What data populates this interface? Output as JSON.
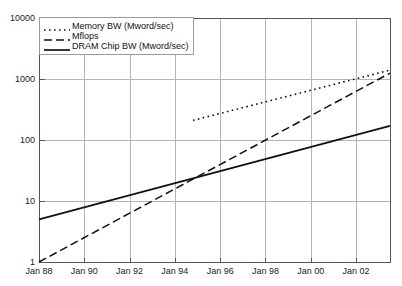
{
  "chart_data": {
    "type": "line",
    "title": "",
    "xlabel": "",
    "ylabel": "",
    "yscale": "log",
    "ylim": [
      1,
      10000
    ],
    "xlim": [
      1988,
      2003.5
    ],
    "grid": true,
    "legend_position": "top-left",
    "ytick_labels": [
      "10000",
      "1000",
      "100",
      "10",
      "1"
    ],
    "ytick_values": [
      10000,
      1000,
      100,
      10,
      1
    ],
    "xtick_labels": [
      "Jan 88",
      "Jan 90",
      "Jan 92",
      "Jan 94",
      "Jan 96",
      "Jan 98",
      "Jan 00",
      "Jan 02"
    ],
    "xtick_values": [
      1988,
      1990,
      1992,
      1994,
      1996,
      1998,
      2000,
      2002
    ],
    "series": [
      {
        "name": "Memory BW (Mword/sec)",
        "style": "dotted",
        "color": "#111111",
        "x": [
          1994.8,
          2003.5
        ],
        "values": [
          210,
          1400
        ]
      },
      {
        "name": "Mflops",
        "style": "dashed",
        "color": "#111111",
        "x": [
          1988,
          2003.5
        ],
        "values": [
          1,
          1250
        ]
      },
      {
        "name": "DRAM Chip BW (Mword/sec)",
        "style": "solid",
        "color": "#111111",
        "x": [
          1988,
          2003.5
        ],
        "values": [
          5,
          170
        ]
      }
    ]
  },
  "legend": {
    "items": [
      {
        "label": "Memory BW (Mword/sec)",
        "style": "dotted"
      },
      {
        "label": "Mflops",
        "style": "dashed"
      },
      {
        "label": "DRAM Chip BW (Mword/sec)",
        "style": "solid"
      }
    ]
  },
  "colors": {
    "axis": "#555555",
    "grid": "#b4b4b4",
    "line": "#111111",
    "text": "#1a1a1a",
    "background": "#ffffff"
  }
}
